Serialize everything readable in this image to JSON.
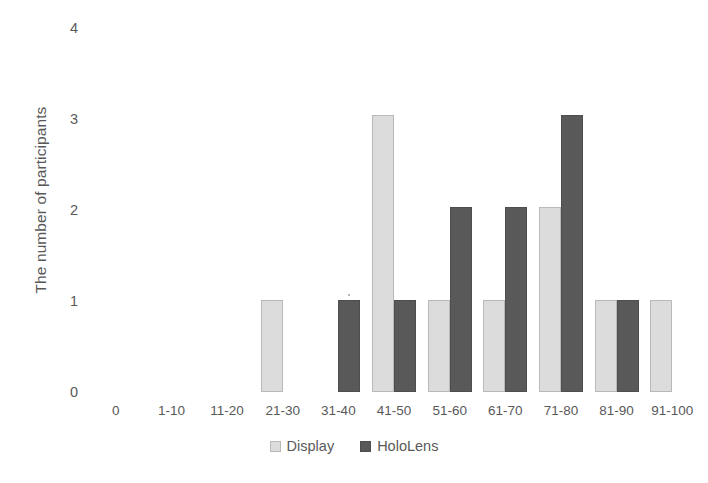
{
  "chart_data": {
    "type": "bar",
    "title": "",
    "xlabel": "",
    "ylabel": "The number of participants",
    "ylim": [
      0,
      4
    ],
    "yticks": [
      "0",
      "1",
      "2",
      "3",
      "4"
    ],
    "grid": false,
    "legend_position": "bottom-center",
    "categories": [
      "0",
      "1-10",
      "11-20",
      "21-30",
      "31-40",
      "41-50",
      "51-60",
      "61-70",
      "71-80",
      "81-90",
      "91-100"
    ],
    "series": [
      {
        "name": "Display",
        "color": "#dcdcdc",
        "values": [
          0,
          0,
          0,
          1,
          0,
          3,
          1,
          1,
          2,
          1,
          1
        ]
      },
      {
        "name": "HoloLens",
        "color": "#595959",
        "values": [
          0,
          0,
          0,
          0,
          1,
          1,
          2,
          2,
          3,
          1,
          0
        ]
      }
    ]
  },
  "axes": {
    "y_title": "The number of participants",
    "y_tick_labels": [
      "4",
      "3",
      "2",
      "1",
      "0"
    ],
    "x_tick_labels": [
      "0",
      "1-10",
      "11-20",
      "21-30",
      "31-40",
      "41-50",
      "51-60",
      "61-70",
      "71-80",
      "81-90",
      "91-100"
    ]
  },
  "legend": {
    "entries": [
      {
        "label": "Display",
        "swatch": "light-gray-square-icon"
      },
      {
        "label": "HoloLens",
        "swatch": "dark-gray-square-icon"
      }
    ]
  }
}
